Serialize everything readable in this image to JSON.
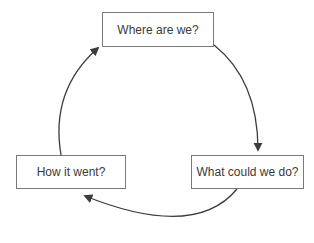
{
  "diagram": {
    "type": "cycle",
    "nodes": [
      {
        "id": "top",
        "label": "Where are we?"
      },
      {
        "id": "right",
        "label": "What could we do?"
      },
      {
        "id": "left",
        "label": "How it went?"
      }
    ],
    "edges": [
      {
        "from": "top",
        "to": "right"
      },
      {
        "from": "right",
        "to": "left"
      },
      {
        "from": "left",
        "to": "top"
      }
    ],
    "colors": {
      "stroke": "#3c3c3c",
      "box_border": "#7a7a7a",
      "text": "#3a3a3a"
    }
  }
}
